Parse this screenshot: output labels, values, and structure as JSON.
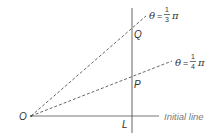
{
  "diagram": {
    "origin_label": "O",
    "foot_label": "L",
    "point_q_label": "Q",
    "point_p_label": "P",
    "initial_line_label": "Initial line",
    "ray_upper": {
      "theta": "θ",
      "equals": "=",
      "numerator": "1",
      "denominator": "3",
      "pi": "π"
    },
    "ray_lower": {
      "theta": "θ",
      "equals": "=",
      "numerator": "1",
      "denominator": "4",
      "pi": "π"
    },
    "colors": {
      "line": "#555555",
      "text": "#333333",
      "initial_line_text": "#7a7a7a"
    }
  }
}
